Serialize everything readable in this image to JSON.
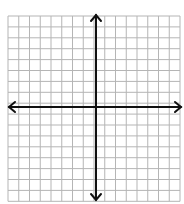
{
  "diagram": {
    "type": "coordinate-grid",
    "grid": {
      "columns": 16,
      "rows": 17,
      "left": 8,
      "top": 16,
      "cell_w": 10.75,
      "cell_h": 10.9,
      "line_color": "#b5b5b5"
    },
    "axes": {
      "x_axis_y": 107,
      "y_axis_x": 96,
      "color": "#111111",
      "arrows": [
        "left",
        "right",
        "up",
        "down"
      ]
    }
  }
}
